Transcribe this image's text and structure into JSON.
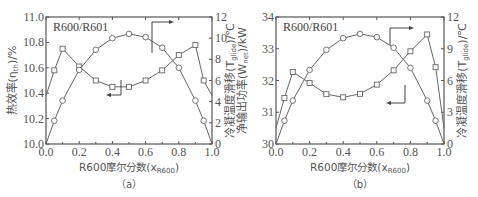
{
  "chart_data": [
    {
      "type": "line",
      "panel": "(a)",
      "title": "R600/R601",
      "xlabel": "R600摩尔分数(x_R600)",
      "ylabel_left": "热效率(η_th)/%",
      "ylabel_right": "冷凝温度滑移(T_glide)/℃",
      "xlim": [
        0,
        1
      ],
      "ylim_left": [
        10.0,
        11.0
      ],
      "ylim_right": [
        0,
        12
      ],
      "x_ticks": [
        "0.0",
        "0.2",
        "0.4",
        "0.6",
        "0.8",
        "1.0"
      ],
      "y_ticks_left": [
        "10.0",
        "10.2",
        "10.4",
        "10.6",
        "10.8",
        "11.0"
      ],
      "y_ticks_right": [
        "0",
        "2",
        "4",
        "6",
        "8",
        "10",
        "12"
      ],
      "x": [
        0,
        0.05,
        0.1,
        0.2,
        0.3,
        0.4,
        0.5,
        0.6,
        0.7,
        0.8,
        0.9,
        0.95,
        1.0
      ],
      "series": [
        {
          "name": "热效率",
          "axis": "left",
          "marker": "square",
          "values": [
            10.38,
            10.58,
            10.75,
            10.61,
            10.5,
            10.45,
            10.45,
            10.5,
            10.58,
            10.7,
            10.78,
            10.5,
            10.38
          ]
        },
        {
          "name": "冷凝温度滑移",
          "axis": "right",
          "marker": "circle",
          "values": [
            0,
            2.2,
            4.1,
            7.0,
            8.9,
            10.0,
            10.4,
            10.1,
            9.1,
            7.2,
            4.1,
            2.2,
            0
          ]
        }
      ],
      "grid": false
    },
    {
      "type": "line",
      "panel": "(b)",
      "title": "R600/R601",
      "xlabel": "R600摩尔分数(x_R600)",
      "ylabel_left": "净输出功率(W_net)/kW",
      "ylabel_right": "冷凝温度滑移(T_glide)/℃",
      "xlim": [
        0,
        1
      ],
      "ylim_left": [
        30,
        34
      ],
      "ylim_right": [
        0,
        12
      ],
      "x_ticks": [
        "0.0",
        "0.2",
        "0.4",
        "0.6",
        "0.8",
        "1.0"
      ],
      "y_ticks_left": [
        "30",
        "31",
        "32",
        "33",
        "34"
      ],
      "y_ticks_right": [
        "0",
        "3",
        "6",
        "9",
        "12"
      ],
      "x": [
        0,
        0.05,
        0.1,
        0.2,
        0.3,
        0.4,
        0.5,
        0.6,
        0.7,
        0.8,
        0.9,
        0.95,
        1.0
      ],
      "series": [
        {
          "name": "净输出功率",
          "axis": "left",
          "marker": "square",
          "values": [
            30.5,
            31.45,
            32.27,
            31.92,
            31.57,
            31.47,
            31.58,
            31.87,
            32.32,
            32.92,
            33.45,
            32.42,
            30.5
          ]
        },
        {
          "name": "冷凝温度滑移",
          "axis": "right",
          "marker": "circle",
          "values": [
            0,
            2.2,
            4.1,
            7.0,
            8.9,
            10.0,
            10.4,
            10.1,
            9.1,
            7.2,
            4.1,
            2.2,
            0
          ]
        }
      ],
      "grid": false
    }
  ],
  "labels": {
    "a": {
      "title": "R600/R601",
      "ylabel_left": "热效率(η",
      "ylabel_left_sub": "th",
      "ylabel_left_tail": ")/%",
      "ylabel_right": "冷凝温度滑移(T",
      "ylabel_right_sub": "glide",
      "ylabel_right_tail": ")/℃",
      "xlabel": "R600摩尔分数(x",
      "xlabel_sub": "R600",
      "xlabel_tail": ")",
      "caption": "（a）"
    },
    "b": {
      "title": "R600/R601",
      "ylabel_left": "净输出功率(W",
      "ylabel_left_sub": "net",
      "ylabel_left_tail": ")/kW",
      "ylabel_right": "冷凝温度滑移(T",
      "ylabel_right_sub": "glide",
      "ylabel_right_tail": ")/℃",
      "xlabel": "R600摩尔分数(x",
      "xlabel_sub": "R600",
      "xlabel_tail": ")",
      "caption": "（b）"
    }
  },
  "colors": {
    "axis": "#555555",
    "line": "#666666",
    "marker_fill": "#ffffff"
  }
}
